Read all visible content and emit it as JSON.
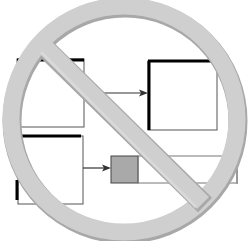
{
  "diagram": {
    "colors": {
      "background": "#ffffff",
      "box_stroke": "#000000",
      "thin_stroke": "#555555",
      "gray_box_fill": "#a9a9a9",
      "sign_fill": "#cfcfcf",
      "sign_shadow": "#a8a8a8"
    },
    "nodes": [
      {
        "id": "box-top-left",
        "label": ""
      },
      {
        "id": "box-top-right",
        "label": ""
      },
      {
        "id": "box-bottom-left",
        "label": ""
      },
      {
        "id": "box-gray",
        "label": ""
      },
      {
        "id": "box-long",
        "label": ""
      }
    ],
    "edges": [
      {
        "from": "box-top-left",
        "to": "box-top-right"
      },
      {
        "from": "box-bottom-left",
        "to": "box-gray"
      }
    ],
    "overlay": {
      "icon": "prohibition-icon"
    }
  }
}
